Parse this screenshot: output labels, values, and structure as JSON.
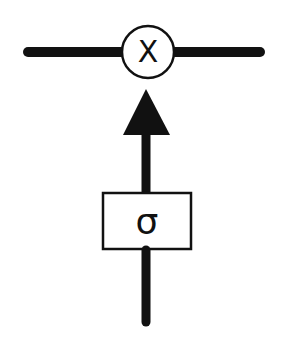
{
  "diagram": {
    "type": "gate-diagram",
    "colors": {
      "stroke": "#111111",
      "background": "#ffffff"
    },
    "nodes": [
      {
        "id": "multiply",
        "shape": "circle",
        "label": "X"
      },
      {
        "id": "sigmoid",
        "shape": "rectangle",
        "label": "σ"
      }
    ],
    "edges": [
      {
        "from": "left",
        "to": "multiply",
        "style": "thick-line"
      },
      {
        "from": "multiply",
        "to": "right",
        "style": "thick-line"
      },
      {
        "from": "sigmoid",
        "to": "multiply",
        "style": "arrow"
      },
      {
        "from": "bottom-input",
        "to": "sigmoid",
        "style": "thick-line"
      }
    ]
  },
  "labels": {
    "multiply": "X",
    "sigmoid": "σ"
  }
}
